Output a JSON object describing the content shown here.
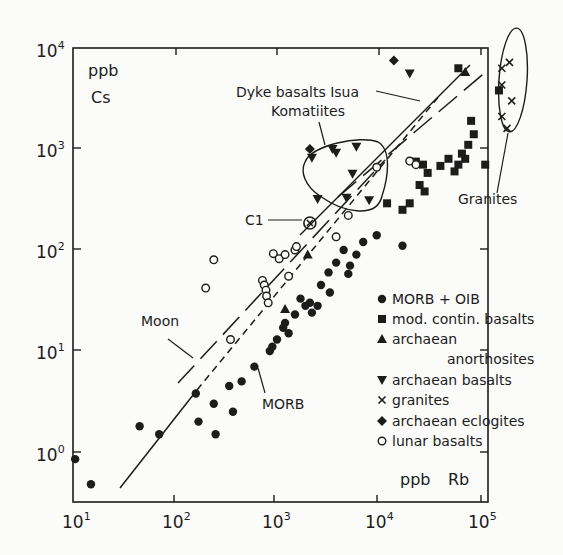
{
  "chart_data": {
    "type": "scatter",
    "title": "",
    "xlabel": "ppb Rb",
    "ylabel": "ppb Cs",
    "xscale": "log",
    "yscale": "log",
    "xlim": [
      10,
      120000
    ],
    "ylim": [
      0.32,
      10000
    ],
    "grid": false,
    "legend_position": "lower right (inside plot)",
    "x_ticks": [
      {
        "value": 10,
        "base": "10",
        "exp": "1"
      },
      {
        "value": 100,
        "base": "10",
        "exp": "2"
      },
      {
        "value": 1000,
        "base": "10",
        "exp": "3"
      },
      {
        "value": 10000,
        "base": "10",
        "exp": "4"
      },
      {
        "value": 100000,
        "base": "10",
        "exp": "5"
      }
    ],
    "y_ticks": [
      {
        "value": 1,
        "base": "10",
        "exp": "0"
      },
      {
        "value": 10,
        "base": "10",
        "exp": "1"
      },
      {
        "value": 100,
        "base": "10",
        "exp": "2"
      },
      {
        "value": 1000,
        "base": "10",
        "exp": "3"
      },
      {
        "value": 10000,
        "base": "10",
        "exp": "4"
      }
    ],
    "series": [
      {
        "name": "MORB + OIB",
        "marker": "filled-circle",
        "points": [
          [
            10.5,
            0.85
          ],
          [
            15,
            0.48
          ],
          [
            45,
            1.8
          ],
          [
            70,
            1.5
          ],
          [
            170,
            2.0
          ],
          [
            160,
            3.8
          ],
          [
            240,
            3.0
          ],
          [
            250,
            1.5
          ],
          [
            340,
            4.5
          ],
          [
            370,
            2.5
          ],
          [
            450,
            5.0
          ],
          [
            600,
            7.0
          ],
          [
            850,
            10
          ],
          [
            900,
            11
          ],
          [
            1000,
            13
          ],
          [
            1150,
            17
          ],
          [
            1200,
            19
          ],
          [
            1300,
            15
          ],
          [
            1500,
            23
          ],
          [
            1700,
            33
          ],
          [
            2100,
            30
          ],
          [
            2200,
            24
          ],
          [
            2500,
            28
          ],
          [
            3300,
            38
          ],
          [
            5000,
            58
          ],
          [
            5200,
            70
          ],
          [
            6000,
            90
          ],
          [
            9500,
            140
          ],
          [
            17000,
            110
          ],
          [
            3200,
            60
          ],
          [
            3800,
            75
          ],
          [
            4500,
            100
          ],
          [
            7000,
            120
          ],
          [
            2700,
            45
          ],
          [
            1900,
            28
          ]
        ]
      },
      {
        "name": "mod. contin. basalts",
        "marker": "filled-square",
        "points": [
          [
            12000,
            290
          ],
          [
            17000,
            250
          ],
          [
            20000,
            290
          ],
          [
            25000,
            440
          ],
          [
            28000,
            380
          ],
          [
            30000,
            580
          ],
          [
            40000,
            680
          ],
          [
            48000,
            800
          ],
          [
            55000,
            600
          ],
          [
            60000,
            700
          ],
          [
            65000,
            900
          ],
          [
            75000,
            1100
          ],
          [
            80000,
            1900
          ],
          [
            85000,
            1400
          ],
          [
            70000,
            800
          ],
          [
            110000,
            700
          ],
          [
            60000,
            6300
          ],
          [
            150000,
            3800
          ],
          [
            23000,
            750
          ],
          [
            27000,
            700
          ]
        ]
      },
      {
        "name": "archaean anorthosites",
        "marker": "filled-triangle",
        "points": [
          [
            1200,
            26
          ],
          [
            2000,
            90
          ],
          [
            70000,
            5800
          ]
        ]
      },
      {
        "name": "archaean basalts",
        "marker": "filled-triangle-down",
        "points": [
          [
            2200,
            820
          ],
          [
            3500,
            1000
          ],
          [
            3800,
            920
          ],
          [
            6000,
            1050
          ],
          [
            5500,
            570
          ],
          [
            4800,
            330
          ],
          [
            8000,
            310
          ],
          [
            2500,
            320
          ],
          [
            20000,
            5600
          ]
        ]
      },
      {
        "name": "granites",
        "marker": "x",
        "points": [
          [
            160000,
            6300
          ],
          [
            190000,
            7200
          ],
          [
            160000,
            4300
          ],
          [
            200000,
            3000
          ],
          [
            160000,
            2100
          ],
          [
            180000,
            1600
          ]
        ]
      },
      {
        "name": "archaean eclogites",
        "marker": "filled-diamond",
        "points": [
          [
            14000,
            7500
          ],
          [
            2100,
            1000
          ]
        ]
      },
      {
        "name": "lunar basalts",
        "marker": "open-circle",
        "points": [
          [
            200,
            42
          ],
          [
            240,
            80
          ],
          [
            350,
            13
          ],
          [
            720,
            50
          ],
          [
            750,
            45
          ],
          [
            780,
            40
          ],
          [
            790,
            35
          ],
          [
            820,
            30
          ],
          [
            920,
            92
          ],
          [
            1050,
            82
          ],
          [
            1200,
            90
          ],
          [
            1500,
            100
          ],
          [
            1550,
            108
          ],
          [
            1300,
            55
          ],
          [
            3800,
            135
          ],
          [
            5000,
            220
          ],
          [
            9500,
            660
          ],
          [
            20000,
            760
          ],
          [
            23000,
            700
          ]
        ]
      },
      {
        "name": "C1",
        "marker": "circled-x",
        "points": [
          [
            2100,
            185
          ]
        ]
      }
    ],
    "reference_lines": [
      {
        "name": "MORB",
        "style": "solid then dashed",
        "from": [
          35,
          0.45
        ],
        "to": [
          90000,
          4000
        ]
      },
      {
        "name": "Moon",
        "style": "long dashed",
        "from": [
          110,
          15
        ],
        "to": [
          9000,
          650
        ]
      },
      {
        "name": "Dyke basalts Isua",
        "style": "solid",
        "from": [
          1200,
          55
        ],
        "to": [
          70000,
          5000
        ]
      },
      {
        "name": "upper dashed",
        "style": "long dashed",
        "from": [
          3000,
          200
        ],
        "to": [
          110000,
          5000
        ]
      }
    ],
    "annotations": [
      {
        "text": "Dyke basalts Isua"
      },
      {
        "text": "Komatiites"
      },
      {
        "text": "C1"
      },
      {
        "text": "Granites"
      },
      {
        "text": "Moon"
      },
      {
        "text": "MORB"
      }
    ]
  },
  "labels": {
    "y_unit": "ppb",
    "y_element": "Cs",
    "x_unit": "ppb",
    "x_element": "Rb",
    "dyke": "Dyke basalts Isua",
    "komatiites": "Komatiites",
    "c1": "C1",
    "granites": "Granites",
    "moon": "Moon",
    "morb": "MORB"
  },
  "legend": {
    "items": [
      {
        "marker": "filled-circle",
        "label": "MORB + OIB"
      },
      {
        "marker": "filled-square",
        "label": "mod. contin. basalts"
      },
      {
        "marker": "filled-triangle",
        "label": "archaean"
      },
      {
        "marker": "none",
        "label": "anorthosites"
      },
      {
        "marker": "filled-triangle-down",
        "label": "archaean basalts"
      },
      {
        "marker": "x",
        "label": "granites"
      },
      {
        "marker": "filled-diamond",
        "label": "archaean eclogites"
      },
      {
        "marker": "open-circle",
        "label": "lunar basalts"
      }
    ]
  },
  "colors": {
    "ink": "#1c1c1c",
    "background": "#fbfbf9"
  }
}
